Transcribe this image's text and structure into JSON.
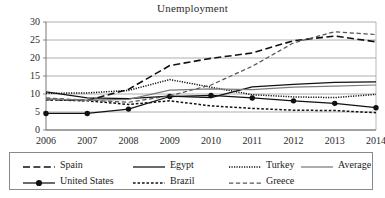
{
  "chart_data": {
    "type": "line",
    "title": "Unemployment",
    "xlabel": "",
    "ylabel": "",
    "x": [
      2006,
      2007,
      2008,
      2009,
      2010,
      2011,
      2012,
      2013,
      2014
    ],
    "categories": [
      "2006",
      "2007",
      "2008",
      "2009",
      "2010",
      "2011",
      "2012",
      "2013",
      "2014"
    ],
    "ylim": [
      0,
      30
    ],
    "yticks": [
      0,
      5,
      10,
      15,
      20,
      25,
      30
    ],
    "ytick_labels": [
      "0",
      "5",
      "10",
      "15",
      "20",
      "25",
      "30"
    ],
    "grid": "horizontal",
    "legend_position": "bottom",
    "series": [
      {
        "name": "Spain",
        "style": "dashed",
        "color": "#111111",
        "marker": "none",
        "values": [
          8.5,
          8.2,
          11.3,
          17.9,
          19.9,
          21.4,
          24.8,
          26.1,
          24.5
        ]
      },
      {
        "name": "United States",
        "style": "solid",
        "color": "#111111",
        "marker": "circle",
        "values": [
          4.6,
          4.6,
          5.8,
          9.3,
          9.6,
          8.9,
          8.1,
          7.4,
          6.2
        ]
      },
      {
        "name": "Egypt",
        "style": "solid",
        "color": "#111111",
        "marker": "none",
        "values": [
          10.6,
          8.9,
          8.7,
          9.4,
          9.0,
          12.0,
          12.7,
          13.2,
          13.4
        ]
      },
      {
        "name": "Brazil",
        "style": "fine-dashed",
        "color": "#111111",
        "marker": "none",
        "values": [
          8.4,
          8.1,
          7.1,
          8.1,
          6.7,
          6.0,
          5.5,
          5.4,
          4.8
        ]
      },
      {
        "name": "Turkey",
        "style": "dotted",
        "color": "#111111",
        "marker": "none",
        "values": [
          10.2,
          10.3,
          11.0,
          14.0,
          11.9,
          9.8,
          9.2,
          9.0,
          9.9
        ]
      },
      {
        "name": "Greece",
        "style": "medium-dashed",
        "color": "#555555",
        "marker": "none",
        "values": [
          8.9,
          8.3,
          7.7,
          9.5,
          12.5,
          17.7,
          24.2,
          27.3,
          26.5
        ]
      },
      {
        "name": "Average",
        "style": "solid",
        "color": "#7c7c7c",
        "marker": "none",
        "values": [
          8.6,
          8.3,
          8.5,
          11.1,
          11.4,
          11.2,
          11.9,
          12.2,
          12.5
        ]
      }
    ]
  },
  "legend": {
    "entries": [
      {
        "label": "Spain",
        "key": "spain"
      },
      {
        "label": "Egypt",
        "key": "egypt"
      },
      {
        "label": "Turkey",
        "key": "turkey"
      },
      {
        "label": "Average",
        "key": "average"
      },
      {
        "label": "United States",
        "key": "united-states"
      },
      {
        "label": "Brazil",
        "key": "brazil"
      },
      {
        "label": "Greece",
        "key": "greece"
      }
    ]
  }
}
